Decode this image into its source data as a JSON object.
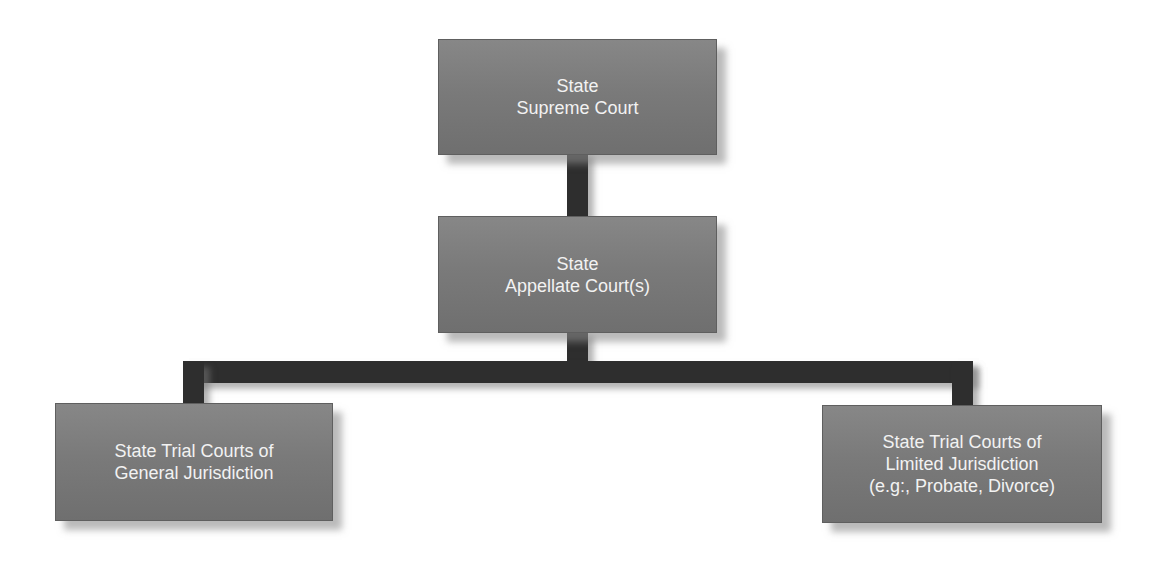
{
  "diagram": {
    "colors": {
      "node_fill": "#7a7a7a",
      "node_text": "#f2f2f2",
      "connector": "#2e2e2e",
      "background": "#ffffff"
    },
    "nodes": [
      {
        "id": "supreme",
        "label": "State\nSupreme Court"
      },
      {
        "id": "appellate",
        "label": "State\nAppellate Court(s)"
      },
      {
        "id": "general",
        "label": "State Trial Courts of\nGeneral Jurisdiction"
      },
      {
        "id": "limited",
        "label": "State Trial Courts of\nLimited Jurisdiction\n(e.g:, Probate, Divorce)"
      }
    ],
    "edges": [
      {
        "from": "supreme",
        "to": "appellate"
      },
      {
        "from": "appellate",
        "to": "general"
      },
      {
        "from": "appellate",
        "to": "limited"
      }
    ]
  }
}
